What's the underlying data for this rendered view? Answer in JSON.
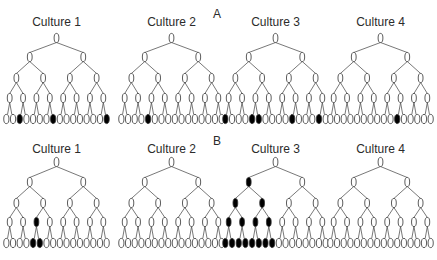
{
  "figure": {
    "panels": [
      {
        "label": "A",
        "label_pos": [
          213,
          7
        ],
        "title_y": 15,
        "level_y": [
          38,
          57,
          78,
          98,
          119
        ],
        "cultures": [
          {
            "title": "Culture 1",
            "x0": 3,
            "filled": {
              "0": [],
              "1": [],
              "2": [],
              "3": [],
              "4": [
                2,
                7,
                15
              ]
            }
          },
          {
            "title": "Culture 2",
            "x0": 118,
            "filled": {
              "0": [],
              "1": [],
              "2": [],
              "3": [],
              "4": [
                4
              ]
            }
          },
          {
            "title": "Culture 3",
            "x0": 222,
            "filled": {
              "0": [],
              "1": [],
              "2": [],
              "3": [],
              "4": [
                0,
                4,
                5,
                10,
                14
              ]
            }
          },
          {
            "title": "Culture 4",
            "x0": 327,
            "filled": {
              "0": [],
              "1": [],
              "2": [],
              "3": [],
              "4": [
                10
              ]
            }
          }
        ]
      },
      {
        "label": "B",
        "label_pos": [
          213,
          134
        ],
        "title_y": 142,
        "level_y": [
          162,
          182,
          203,
          222,
          243
        ],
        "cultures": [
          {
            "title": "Culture 1",
            "x0": 3,
            "filled": {
              "0": [],
              "1": [],
              "2": [],
              "3": [
                2
              ],
              "4": [
                4,
                5
              ]
            }
          },
          {
            "title": "Culture 2",
            "x0": 118,
            "filled": {
              "0": [],
              "1": [],
              "2": [],
              "3": [],
              "4": []
            }
          },
          {
            "title": "Culture 3",
            "x0": 222,
            "filled": {
              "0": [],
              "1": [
                0
              ],
              "2": [
                0,
                1
              ],
              "3": [
                0,
                1,
                2,
                3
              ],
              "4": [
                0,
                1,
                2,
                3,
                4,
                5,
                6,
                7
              ]
            }
          },
          {
            "title": "Culture 4",
            "x0": 327,
            "filled": {
              "0": [],
              "1": [],
              "2": [],
              "3": [],
              "4": []
            }
          }
        ]
      }
    ],
    "tree": {
      "levels": 5,
      "leaf_count": 16,
      "width": 107
    },
    "colors": {
      "line": "#555555",
      "node_stroke": "#333333",
      "filled": "#000000",
      "empty": "#ffffff",
      "text": "#2b2b2b"
    }
  }
}
